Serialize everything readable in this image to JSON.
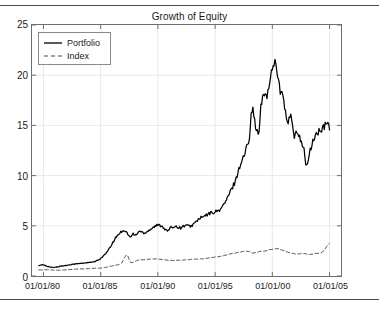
{
  "chart_data": {
    "type": "line",
    "title": "Growth of Equity",
    "xlabel": "",
    "ylabel": "",
    "grid": true,
    "legend_position": "top-left",
    "xlim": [
      "01/01/79",
      "01/01/06"
    ],
    "ylim": [
      0,
      25
    ],
    "yticks": [
      0,
      5,
      10,
      15,
      20,
      25
    ],
    "ytick_labels": [
      "0",
      "5",
      "10",
      "15",
      "20",
      "25"
    ],
    "xticks": [
      "01/01/80",
      "01/01/85",
      "01/01/90",
      "01/01/95",
      "01/01/00",
      "01/01/05"
    ],
    "xtick_labels": [
      "01/01/80",
      "01/01/85",
      "01/01/90",
      "01/01/95",
      "01/01/00",
      "01/01/05"
    ],
    "series": [
      {
        "name": "Portfolio",
        "style": "solid",
        "color": "#000000",
        "x": [
          "1979.6",
          "1980.0",
          "1980.4",
          "1980.8",
          "1981.2",
          "1981.6",
          "1982.0",
          "1982.4",
          "1982.8",
          "1983.2",
          "1983.6",
          "1984.0",
          "1984.4",
          "1984.8",
          "1985.2",
          "1985.6",
          "1986.0",
          "1986.4",
          "1986.8",
          "1987.0",
          "1987.3",
          "1987.6",
          "1987.8",
          "1988.0",
          "1988.4",
          "1988.8",
          "1989.2",
          "1989.6",
          "1990.0",
          "1990.4",
          "1990.8",
          "1991.2",
          "1991.6",
          "1992.0",
          "1992.4",
          "1992.8",
          "1993.2",
          "1993.6",
          "1994.0",
          "1994.4",
          "1994.8",
          "1995.2",
          "1995.6",
          "1996.0",
          "1996.4",
          "1996.8",
          "1997.2",
          "1997.6",
          "1998.0",
          "1998.2",
          "1998.5",
          "1998.8",
          "1999.0",
          "1999.3",
          "1999.6",
          "1999.8",
          "2000.0",
          "2000.2",
          "2000.4",
          "2000.7",
          "2001.0",
          "2001.3",
          "2001.6",
          "2001.9",
          "2002.2",
          "2002.5",
          "2002.8",
          "2003.0",
          "2003.3",
          "2003.6",
          "2004.0",
          "2004.4",
          "2004.8",
          "2005.0"
        ],
        "y": [
          1.05,
          1.1,
          0.95,
          0.85,
          0.9,
          1.0,
          1.05,
          1.15,
          1.2,
          1.25,
          1.3,
          1.35,
          1.4,
          1.6,
          1.95,
          2.45,
          3.2,
          3.95,
          4.4,
          4.55,
          4.3,
          3.85,
          4.2,
          4.05,
          4.45,
          4.3,
          4.55,
          4.85,
          5.05,
          4.95,
          4.5,
          4.85,
          4.95,
          4.8,
          5.05,
          4.95,
          5.25,
          5.7,
          5.9,
          6.15,
          6.35,
          6.45,
          6.85,
          7.6,
          8.55,
          9.6,
          11.1,
          12.2,
          14.0,
          16.7,
          15.2,
          14.1,
          16.8,
          18.1,
          18.2,
          19.3,
          20.9,
          21.3,
          20.7,
          18.3,
          17.6,
          15.1,
          16.0,
          13.9,
          14.3,
          13.6,
          12.3,
          11.0,
          12.4,
          13.6,
          14.3,
          14.6,
          15.2,
          14.9
        ]
      },
      {
        "name": "Index",
        "style": "dashed",
        "color": "#4a4a4a",
        "x": [
          "1979.6",
          "1980.4",
          "1981.2",
          "1982.0",
          "1982.8",
          "1983.6",
          "1984.4",
          "1985.2",
          "1986.0",
          "1986.8",
          "1987.3",
          "1987.6",
          "1988.2",
          "1989.0",
          "1989.8",
          "1990.6",
          "1991.4",
          "1992.2",
          "1993.0",
          "1993.8",
          "1994.6",
          "1995.4",
          "1996.2",
          "1997.0",
          "1997.8",
          "1998.4",
          "1999.0",
          "1999.6",
          "2000.2",
          "2000.8",
          "2001.4",
          "2002.0",
          "2002.6",
          "2003.2",
          "2003.8",
          "2004.4",
          "2005.0"
        ],
        "y": [
          0.6,
          0.62,
          0.58,
          0.62,
          0.68,
          0.72,
          0.76,
          0.82,
          1.0,
          1.25,
          2.1,
          1.35,
          1.55,
          1.65,
          1.7,
          1.6,
          1.55,
          1.6,
          1.65,
          1.7,
          1.8,
          1.95,
          2.15,
          2.35,
          2.45,
          2.3,
          2.45,
          2.55,
          2.7,
          2.6,
          2.35,
          2.2,
          2.25,
          2.15,
          2.25,
          2.4,
          3.3
        ]
      }
    ]
  },
  "figure": {
    "title": "Growth of Equity",
    "top_rule": "",
    "bottom_rule": ""
  },
  "legend": {
    "items": [
      {
        "label": "Portfolio",
        "style": "solid"
      },
      {
        "label": "Index",
        "style": "dashed"
      }
    ]
  },
  "axes": {
    "y_labels": [
      "25",
      "20",
      "15",
      "10",
      "5",
      "0"
    ],
    "x_labels": [
      "01/01/80",
      "01/01/85",
      "01/01/90",
      "01/01/95",
      "01/01/00",
      "01/01/05"
    ]
  },
  "colors": {
    "portfolio": "#000000",
    "index": "#4a4a4a",
    "grid": "#e9e9e9",
    "axis": "#6e6e6e",
    "rule": "#4a4a4a",
    "text": "#1a1a1a"
  }
}
